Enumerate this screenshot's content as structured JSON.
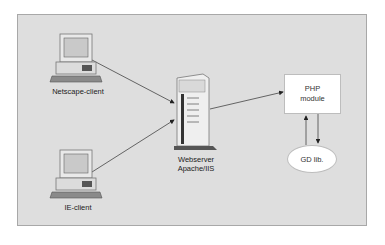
{
  "diagram": {
    "nodes": {
      "netscape_client": {
        "label": "Netscape-client",
        "icon": "desktop-computer-icon"
      },
      "ie_client": {
        "label": "IE-client",
        "icon": "desktop-computer-icon"
      },
      "webserver": {
        "label_line1": "Webserver",
        "label_line2": "Apache/IIS",
        "icon": "server-tower-icon"
      },
      "php_module": {
        "label_line1": "PHP",
        "label_line2": "module"
      },
      "gd_lib": {
        "label": "GD lib."
      }
    },
    "edges": [
      {
        "from": "Netscape-client",
        "to": "Webserver Apache/IIS"
      },
      {
        "from": "IE-client",
        "to": "Webserver Apache/IIS"
      },
      {
        "from": "Webserver Apache/IIS",
        "to": "PHP module"
      },
      {
        "from": "GD lib.",
        "to": "PHP module"
      },
      {
        "from": "PHP module",
        "to": "GD lib."
      }
    ],
    "colors": {
      "background": "#dedede",
      "border": "#a8a8a8",
      "box": "#ffffff"
    }
  }
}
